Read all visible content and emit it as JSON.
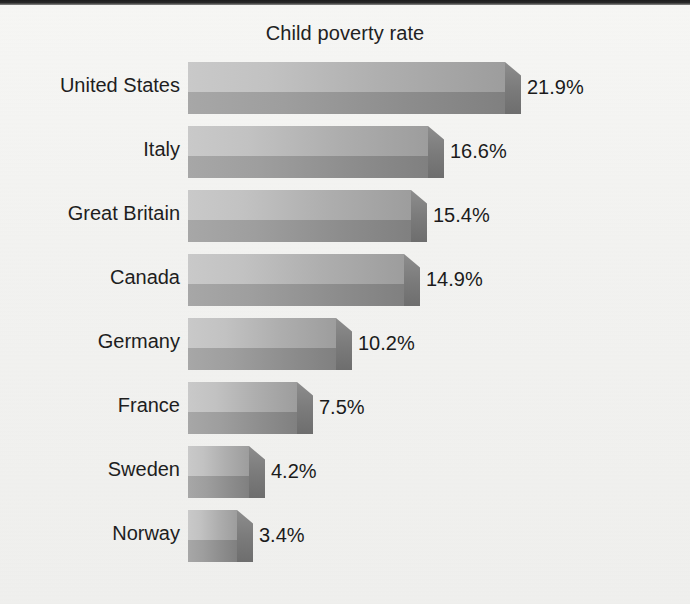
{
  "chart_data": {
    "type": "bar",
    "orientation": "horizontal",
    "title": "Child poverty rate",
    "xlabel": "",
    "ylabel": "",
    "grid": false,
    "legend": false,
    "value_suffix": "%",
    "xlim": [
      0,
      25
    ],
    "categories": [
      "United States",
      "Italy",
      "Great Britain",
      "Canada",
      "Germany",
      "France",
      "Sweden",
      "Norway"
    ],
    "values": [
      21.9,
      16.6,
      15.4,
      14.9,
      10.2,
      7.5,
      4.2,
      3.4
    ],
    "value_labels": [
      "21.9%",
      "16.6%",
      "15.4%",
      "14.9%",
      "10.2%",
      "7.5%",
      "4.2%",
      "3.4%"
    ],
    "series": [
      {
        "name": "Child poverty rate",
        "values": [
          21.9,
          16.6,
          15.4,
          14.9,
          10.2,
          7.5,
          4.2,
          3.4
        ]
      }
    ],
    "bars": [
      {
        "category": "United States",
        "value": 21.9,
        "label": "21.9%"
      },
      {
        "category": "Italy",
        "value": 16.6,
        "label": "16.6%"
      },
      {
        "category": "Great Britain",
        "value": 15.4,
        "label": "15.4%"
      },
      {
        "category": "Canada",
        "value": 14.9,
        "label": "14.9%"
      },
      {
        "category": "Germany",
        "value": 10.2,
        "label": "10.2%"
      },
      {
        "category": "France",
        "value": 7.5,
        "label": "7.5%"
      },
      {
        "category": "Sweden",
        "value": 4.2,
        "label": "4.2%"
      },
      {
        "category": "Norway",
        "value": 3.4,
        "label": "3.4%"
      }
    ],
    "colors": {
      "background": "#f4f4f2",
      "bar_light": "#c9c9c9",
      "bar_dark": "#808080",
      "bar_cap": "#7b7b7b",
      "text": "#1e1e1e"
    }
  }
}
